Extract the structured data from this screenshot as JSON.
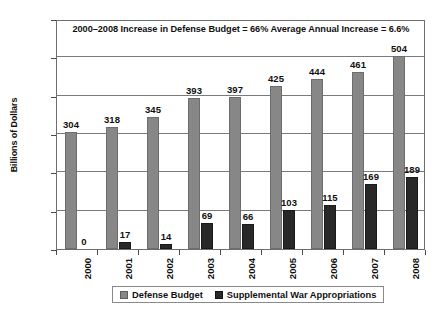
{
  "chart_data": {
    "type": "bar",
    "title": "2000–2008 Increase in Defense Budget = 66%   Average Annual Increase = 6.6%",
    "xlabel": "",
    "ylabel": "Billions of Dollars",
    "ylim": [
      0,
      600
    ],
    "yticks": [
      0,
      100,
      200,
      300,
      400,
      500,
      600
    ],
    "ytick_labels": [
      "0",
      "100",
      "200",
      "300",
      "400",
      "500",
      "600"
    ],
    "grid": true,
    "legend_position": "bottom",
    "categories": [
      "2000",
      "2001",
      "2002",
      "2003",
      "2004",
      "2005",
      "2006",
      "2007",
      "2008"
    ],
    "series": [
      {
        "name": "Defense Budget",
        "color": "#878787",
        "values": [
          304,
          318,
          345,
          393,
          397,
          425,
          444,
          461,
          504
        ],
        "labels": [
          "304",
          "318",
          "345",
          "393",
          "397",
          "425",
          "444",
          "461",
          "504"
        ]
      },
      {
        "name": "Supplemental War Appropriations",
        "color": "#282828",
        "values": [
          0,
          17,
          14,
          69,
          66,
          103,
          115,
          169,
          189
        ],
        "labels": [
          "0",
          "17",
          "14",
          "69",
          "66",
          "103",
          "115",
          "169",
          "189"
        ]
      }
    ]
  },
  "legend": {
    "items": [
      {
        "label": "Defense Budget",
        "swatch": "defense"
      },
      {
        "label": "Supplemental War Appropriations",
        "swatch": "supplemental"
      }
    ]
  },
  "axes": {
    "y_title": "Billions of Dollars"
  }
}
